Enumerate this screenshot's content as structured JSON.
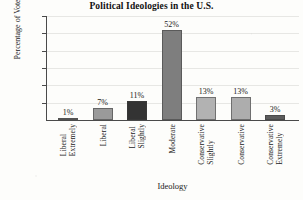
{
  "chart_data": {
    "type": "bar",
    "title": "Political Ideologies in the U.S.",
    "xlabel": "Ideology",
    "ylabel": "Percentage of Voters",
    "categories": [
      "Extremely Liberal",
      "Liberal",
      "Slightly Liberal",
      "Moderate",
      "Slightly Conservative",
      "Conservative",
      "Extremely Conservative"
    ],
    "category_lines": [
      [
        "Extremely",
        "Liberal"
      ],
      [
        "Liberal"
      ],
      [
        "Slightly",
        "Liberal"
      ],
      [
        "Moderate"
      ],
      [
        "Slightly",
        "Conservative"
      ],
      [
        "Conservative"
      ],
      [
        "Extremely",
        "Conservative"
      ]
    ],
    "values": [
      1,
      7,
      11,
      52,
      13,
      13,
      3
    ],
    "value_labels": [
      "1%",
      "7%",
      "11%",
      "52%",
      "13%",
      "13%",
      "3%"
    ],
    "bar_colors": [
      "#6f6f6f",
      "#9a9a9a",
      "#333333",
      "#7e7e7e",
      "#b2b2b2",
      "#adadad",
      "#5c5c5c"
    ],
    "ylim": [
      0,
      60
    ],
    "ytick_values": [
      10,
      20,
      30,
      40,
      50,
      60
    ],
    "ytick_labels": [
      "10%",
      "20%",
      "30%",
      "40%",
      "50%",
      "60%"
    ],
    "grid": true,
    "legend": false,
    "legend_position": "none",
    "axis_color": "#4a4a4a",
    "grid_color": "#e7e7e4",
    "text_color": "#1a1a1a"
  }
}
